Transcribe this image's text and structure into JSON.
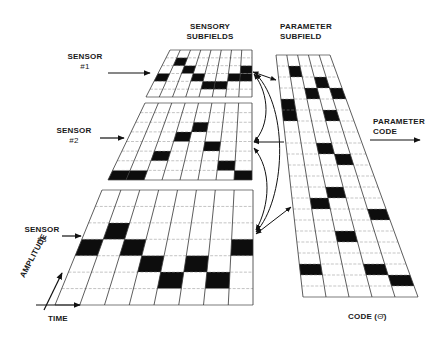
{
  "labels": {
    "sensory_subfields": [
      "SENSORY",
      "SUBFIELDS"
    ],
    "parameter_subfield": [
      "PARAMETER",
      "SUBFIELD"
    ],
    "sensor1": [
      "SENSOR",
      "#1"
    ],
    "sensor2": [
      "SENSOR",
      "#2"
    ],
    "sensor3": [
      "SENSOR",
      "#3"
    ],
    "parameter_code": [
      "PARAMETER",
      "CODE"
    ],
    "amplitude": "AMPLITUDE",
    "time": "TIME",
    "code": "CODE (",
    "code_symbol": "Θ̂",
    "code_close": ")"
  },
  "colors": {
    "ink": "#111111",
    "grid": "#333333",
    "fill": "#0d0d0d",
    "background": "#ffffff"
  },
  "grids": [
    {
      "id": "sensor1",
      "cols": 8,
      "rows": 6,
      "tl": [
        170,
        50
      ],
      "tr": [
        252,
        50
      ],
      "bl": [
        146,
        97
      ],
      "br": [
        252,
        97
      ],
      "filled": [
        [
          0,
          3
        ],
        [
          1,
          1
        ],
        [
          2,
          2
        ],
        [
          3,
          3
        ],
        [
          4,
          4
        ],
        [
          5,
          4
        ],
        [
          7,
          3
        ],
        [
          6,
          3
        ],
        [
          7,
          2
        ]
      ]
    },
    {
      "id": "sensor2",
      "cols": 8,
      "rows": 8,
      "tl": [
        145,
        103
      ],
      "tr": [
        252,
        103
      ],
      "bl": [
        108,
        180
      ],
      "br": [
        252,
        180
      ],
      "filled": [
        [
          0,
          7
        ],
        [
          1,
          7
        ],
        [
          2,
          5
        ],
        [
          3,
          3
        ],
        [
          4,
          2
        ],
        [
          5,
          4
        ],
        [
          6,
          6
        ],
        [
          7,
          7
        ]
      ]
    },
    {
      "id": "sensor3",
      "cols": 8,
      "rows": 7,
      "tl": [
        102,
        190
      ],
      "tr": [
        253,
        190
      ],
      "bl": [
        55,
        305
      ],
      "br": [
        253,
        305
      ],
      "filled": [
        [
          0,
          3
        ],
        [
          1,
          2
        ],
        [
          2,
          3
        ],
        [
          3,
          4
        ],
        [
          4,
          5
        ],
        [
          5,
          4
        ],
        [
          6,
          5
        ],
        [
          7,
          3
        ]
      ]
    },
    {
      "id": "parameter",
      "cols": 5,
      "rows": 22,
      "tl": [
        276,
        55
      ],
      "tr": [
        330,
        55
      ],
      "bl": [
        303,
        297
      ],
      "br": [
        418,
        297
      ],
      "filled": [
        [
          1,
          1
        ],
        [
          3,
          2
        ],
        [
          2,
          3
        ],
        [
          4,
          3
        ],
        [
          0,
          4
        ],
        [
          0,
          5
        ],
        [
          3,
          5
        ],
        [
          2,
          8
        ],
        [
          3,
          9
        ],
        [
          2,
          12
        ],
        [
          1,
          13
        ],
        [
          4,
          14
        ],
        [
          2,
          16
        ],
        [
          0,
          19
        ],
        [
          3,
          19
        ],
        [
          4,
          20
        ]
      ]
    }
  ],
  "chart_data": {
    "type": "diagram",
    "components": [
      "Sensor #1 grid",
      "Sensor #2 grid",
      "Sensor #3 grid",
      "Parameter subfield grid"
    ],
    "axes": {
      "x": "TIME",
      "y": "AMPLITUDE"
    },
    "output": "PARAMETER CODE",
    "code_label": "CODE (Θ̂)"
  }
}
